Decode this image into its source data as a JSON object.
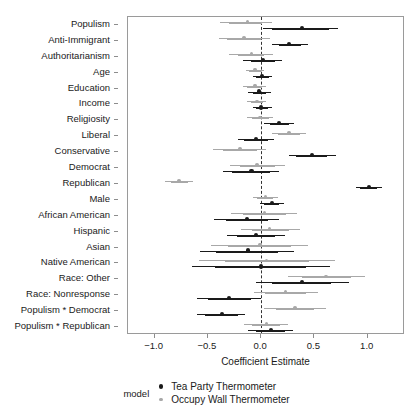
{
  "chart_data": {
    "type": "scatter",
    "title": "",
    "xlabel": "Coefficient Estimate",
    "ylabel": "",
    "xlim": [
      -1.25,
      1.35
    ],
    "ylim": [
      0,
      20
    ],
    "grid": false,
    "zero_reference_line": 0.0,
    "legend_position": "bottom",
    "legend_title": "model",
    "xticks": [
      -1.0,
      -0.5,
      0.0,
      0.5,
      1.0
    ],
    "xticklabels": [
      "-1.0",
      "-0.5",
      "0.0",
      "0.5",
      "1.0"
    ],
    "categories": [
      "Populism",
      "Anti-Immigrant",
      "Authoritarianism",
      "Age",
      "Education",
      "Income",
      "Religiosity",
      "Liberal",
      "Conservative",
      "Democrat",
      "Republican",
      "Male",
      "African American",
      "Hispanic",
      "Asian",
      "Native American",
      "Race: Other",
      "Race: Nonresponse",
      "Populism * Democrat",
      "Populism * Republican"
    ],
    "series": [
      {
        "name": "Tea Party Thermometer",
        "color": "#1a1a1a",
        "marker": "circle",
        "values": [
          0.38,
          0.26,
          0.02,
          0.01,
          -0.02,
          0.0,
          0.17,
          -0.05,
          0.48,
          -0.09,
          1.01,
          0.1,
          -0.13,
          -0.05,
          -0.12,
          0.0,
          0.38,
          -0.3,
          -0.37,
          0.09
        ],
        "ci_inner_low": [
          0.1,
          0.17,
          -0.1,
          -0.05,
          -0.08,
          -0.05,
          0.08,
          -0.16,
          0.33,
          -0.27,
          0.93,
          0.03,
          -0.33,
          -0.23,
          -0.42,
          -0.43,
          0.1,
          -0.5,
          -0.53,
          -0.05
        ],
        "ci_inner_high": [
          0.64,
          0.37,
          0.13,
          0.07,
          0.05,
          0.06,
          0.26,
          0.06,
          0.62,
          0.08,
          1.09,
          0.17,
          0.06,
          0.13,
          0.16,
          0.42,
          0.66,
          -0.1,
          -0.22,
          0.22
        ],
        "ci_outer_low": [
          0.02,
          0.1,
          -0.17,
          -0.08,
          -0.12,
          -0.08,
          0.03,
          -0.22,
          0.26,
          -0.36,
          0.89,
          -0.01,
          -0.44,
          -0.32,
          -0.57,
          -0.65,
          -0.05,
          -0.6,
          -0.6,
          -0.12
        ],
        "ci_outer_high": [
          0.72,
          0.44,
          0.2,
          0.1,
          0.09,
          0.1,
          0.31,
          0.12,
          0.7,
          0.17,
          1.13,
          0.21,
          0.17,
          0.22,
          0.31,
          0.65,
          0.82,
          0.0,
          -0.15,
          0.3
        ]
      },
      {
        "name": "Occupy Wall Thermometer",
        "color": "#a8a8a8",
        "marker": "circle",
        "values": [
          -0.13,
          -0.16,
          -0.09,
          -0.06,
          -0.06,
          -0.04,
          -0.01,
          0.26,
          -0.2,
          -0.04,
          -0.77,
          0.04,
          0.03,
          0.08,
          -0.01,
          0.05,
          0.61,
          0.23,
          0.32,
          0.05
        ],
        "ci_inner_low": [
          -0.3,
          -0.32,
          -0.22,
          -0.11,
          -0.13,
          -0.1,
          -0.09,
          0.16,
          -0.36,
          -0.2,
          -0.85,
          -0.04,
          -0.17,
          -0.09,
          -0.31,
          -0.34,
          0.38,
          0.04,
          0.14,
          -0.09
        ],
        "ci_inner_high": [
          0.01,
          0.0,
          0.03,
          0.0,
          0.01,
          0.02,
          0.07,
          0.36,
          -0.04,
          0.13,
          -0.69,
          0.11,
          0.23,
          0.26,
          0.28,
          0.45,
          0.84,
          0.42,
          0.5,
          0.18
        ],
        "ci_outer_low": [
          -0.39,
          -0.4,
          -0.3,
          -0.14,
          -0.17,
          -0.13,
          -0.13,
          0.1,
          -0.45,
          -0.29,
          -0.9,
          -0.08,
          -0.28,
          -0.19,
          -0.47,
          -0.58,
          0.25,
          -0.07,
          0.03,
          -0.16
        ],
        "ci_outer_high": [
          0.1,
          0.08,
          0.11,
          0.03,
          0.05,
          0.05,
          0.11,
          0.42,
          0.05,
          0.22,
          -0.64,
          0.16,
          0.34,
          0.36,
          0.44,
          0.69,
          0.97,
          0.53,
          0.61,
          0.25
        ]
      }
    ]
  }
}
